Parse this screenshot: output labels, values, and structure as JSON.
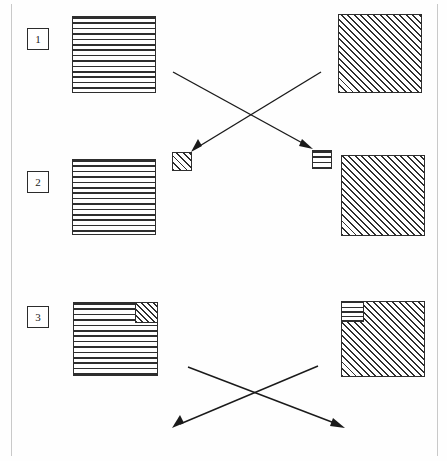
{
  "figure": {
    "background_color": "#ffffff",
    "line_color": "#1a1a1a",
    "pattern_color": "#2e2e2e",
    "width": 447,
    "height": 461
  },
  "rows": [
    {
      "index_label": "1",
      "left_square": {
        "pattern": "horizontal-lines",
        "inset": null
      },
      "right_square": {
        "pattern": "diagonal-hatch",
        "inset": null
      }
    },
    {
      "index_label": "2",
      "left_square": {
        "pattern": "horizontal-lines",
        "inset": null
      },
      "right_square": {
        "pattern": "diagonal-hatch",
        "inset": null
      }
    },
    {
      "index_label": "3",
      "left_square": {
        "pattern": "horizontal-lines",
        "inset": "diagonal-hatch-top-right"
      },
      "right_square": {
        "pattern": "diagonal-hatch",
        "inset": "horizontal-lines-top-left"
      }
    }
  ],
  "targets": {
    "left_small_square": {
      "pattern": "diagonal-hatch"
    },
    "right_small_square": {
      "pattern": "horizontal-lines"
    }
  },
  "arrows": {
    "upper_group": [
      {
        "name": "left-square-to-right-target",
        "from": "row1-left-square",
        "to": "right-small-square",
        "direction": "down-right"
      },
      {
        "name": "right-square-to-left-target",
        "from": "row1-right-square",
        "to": "left-small-square",
        "direction": "down-left"
      }
    ],
    "lower_group": [
      {
        "name": "row3-left-square-outward",
        "from": "row3-left-square",
        "to": "down-right",
        "direction": "down-right"
      },
      {
        "name": "row3-right-square-outward",
        "from": "row3-right-square",
        "to": "down-left",
        "direction": "down-left"
      }
    ]
  }
}
